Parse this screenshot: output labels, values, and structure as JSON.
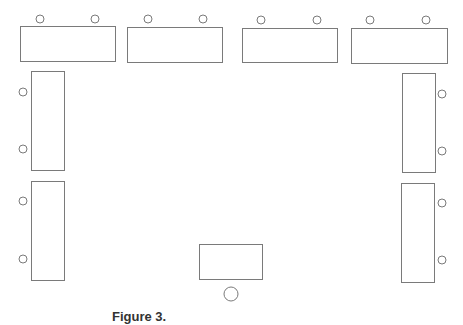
{
  "diagram": {
    "type": "classroom-seating-layout",
    "stroke_color": "#7a7a7a",
    "background": "#ffffff",
    "tables": [
      {
        "id": "top-1",
        "orientation": "horizontal",
        "x": 20,
        "y": 26,
        "w": 95,
        "h": 35,
        "chairs": [
          {
            "cx": 40,
            "cy": 19,
            "r": 4
          },
          {
            "cx": 95,
            "cy": 19,
            "r": 4
          }
        ]
      },
      {
        "id": "top-2",
        "orientation": "horizontal",
        "x": 127,
        "y": 27,
        "w": 95,
        "h": 35,
        "chairs": [
          {
            "cx": 148,
            "cy": 19,
            "r": 4
          },
          {
            "cx": 203,
            "cy": 19,
            "r": 4
          }
        ]
      },
      {
        "id": "top-3",
        "orientation": "horizontal",
        "x": 242,
        "y": 28,
        "w": 95,
        "h": 34,
        "chairs": [
          {
            "cx": 261,
            "cy": 20,
            "r": 4
          },
          {
            "cx": 317,
            "cy": 20,
            "r": 4
          }
        ]
      },
      {
        "id": "top-4",
        "orientation": "horizontal",
        "x": 351,
        "y": 28,
        "w": 96,
        "h": 35,
        "chairs": [
          {
            "cx": 370,
            "cy": 20,
            "r": 4
          },
          {
            "cx": 426,
            "cy": 20,
            "r": 4
          }
        ]
      },
      {
        "id": "left-1",
        "orientation": "vertical",
        "x": 31,
        "y": 71,
        "w": 33,
        "h": 99,
        "chairs": [
          {
            "cx": 23,
            "cy": 92,
            "r": 4
          },
          {
            "cx": 23,
            "cy": 149,
            "r": 4
          }
        ]
      },
      {
        "id": "left-2",
        "orientation": "vertical",
        "x": 31,
        "y": 181,
        "w": 33,
        "h": 99,
        "chairs": [
          {
            "cx": 23,
            "cy": 201,
            "r": 4
          },
          {
            "cx": 23,
            "cy": 259,
            "r": 4
          }
        ]
      },
      {
        "id": "right-1",
        "orientation": "vertical",
        "x": 402,
        "y": 73,
        "w": 33,
        "h": 99,
        "chairs": [
          {
            "cx": 442,
            "cy": 94,
            "r": 4
          },
          {
            "cx": 442,
            "cy": 151,
            "r": 4
          }
        ]
      },
      {
        "id": "right-2",
        "orientation": "vertical",
        "x": 401,
        "y": 183,
        "w": 33,
        "h": 99,
        "chairs": [
          {
            "cx": 442,
            "cy": 203,
            "r": 4
          },
          {
            "cx": 442,
            "cy": 260,
            "r": 4
          }
        ]
      },
      {
        "id": "front-teacher",
        "orientation": "horizontal",
        "x": 199,
        "y": 244,
        "w": 63,
        "h": 35,
        "chairs": [
          {
            "cx": 231,
            "cy": 294,
            "r": 7
          }
        ]
      }
    ],
    "caption": {
      "label": "Figure 3.",
      "text": ""
    }
  }
}
